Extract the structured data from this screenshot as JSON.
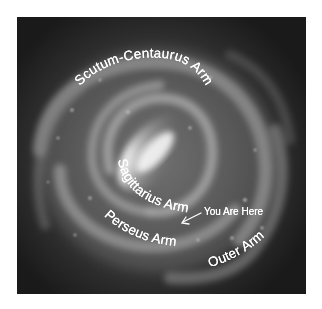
{
  "figure": {
    "frame": {
      "x": 17,
      "y": 17,
      "width": 289,
      "height": 277
    },
    "background_color": "#ffffff",
    "space_color": "#1c1c1c",
    "core_color": "#f4f4f4",
    "label_color": "#ffffff"
  },
  "labels": {
    "scutum_centaurus": "Scutum-Centaurus Arm",
    "sagittarius": "Sagittarius Arm",
    "perseus": "Perseus Arm",
    "outer": "Outer Arm",
    "you_are_here": "You Are Here"
  },
  "annotations": {
    "you_are_here_arrow": {
      "from": [
        201,
        213
      ],
      "to": [
        182,
        223
      ]
    }
  }
}
